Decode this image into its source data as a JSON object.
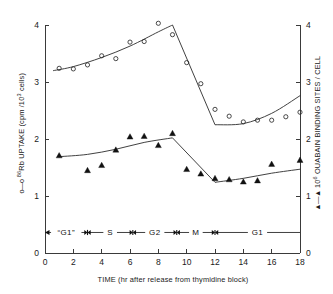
{
  "chart_data": {
    "type": "scatter",
    "title": "",
    "xlabel": "TIME  (hr after release from thymidine block)",
    "ylabel": "o—o  86Rb UPTAKE (cpm / 103 cells)",
    "ylabel_right": "▲—▲  106 OUABAIN BINDING SITES / CELL",
    "xlim": [
      0,
      18
    ],
    "ylim": [
      0,
      4
    ],
    "ylim_right": [
      0,
      4
    ],
    "xticks": [
      0,
      2,
      4,
      6,
      8,
      10,
      12,
      14,
      16,
      18
    ],
    "yticks": [
      0,
      1,
      2,
      3,
      4
    ],
    "yticks_right": [
      0,
      1,
      2,
      3,
      4
    ],
    "grid": false,
    "legend_position": "axis-labels",
    "series": [
      {
        "name": "86Rb uptake (cpm / 10^3 cells)",
        "marker": "open-circle",
        "axis": "left",
        "x": [
          1,
          2,
          3,
          4,
          5,
          6,
          7,
          8,
          9,
          10,
          11,
          12,
          13,
          14,
          15,
          16,
          17,
          18
        ],
        "values": [
          3.24,
          3.23,
          3.3,
          3.46,
          3.41,
          3.7,
          3.71,
          4.03,
          3.83,
          3.34,
          2.97,
          2.52,
          2.4,
          2.3,
          2.33,
          2.33,
          2.39,
          2.47
        ],
        "fit_line_x": [
          0.6,
          2.0,
          4.0,
          6.0,
          8.0,
          9.0,
          12.0,
          14.0,
          16.0,
          18.0
        ],
        "fit_line_y": [
          3.2,
          3.27,
          3.43,
          3.63,
          3.88,
          4.0,
          2.25,
          2.27,
          2.45,
          2.76
        ]
      },
      {
        "name": "10^6 ouabain binding sites / cell",
        "marker": "filled-triangle",
        "axis": "right",
        "x": [
          1,
          3,
          4,
          5,
          6,
          7,
          8,
          9,
          10,
          11,
          12,
          13,
          14,
          15,
          16,
          18
        ],
        "values": [
          1.71,
          1.45,
          1.54,
          1.81,
          2.04,
          2.05,
          1.89,
          2.1,
          1.47,
          1.39,
          1.31,
          1.29,
          1.25,
          1.27,
          1.56,
          1.63
        ],
        "fit_line_x": [
          1.0,
          3.0,
          5.0,
          7.0,
          9.0,
          12.0,
          14.0,
          16.0,
          18.0
        ],
        "fit_line_y": [
          1.69,
          1.73,
          1.82,
          1.94,
          2.02,
          1.24,
          1.31,
          1.4,
          1.47
        ]
      }
    ],
    "phase_bar": {
      "y_value": 0.36,
      "segments": [
        {
          "label": "“G1”",
          "start": 0.0,
          "end": 3.0
        },
        {
          "label": "S",
          "start": 3.0,
          "end": 6.2
        },
        {
          "label": "G2",
          "start": 6.2,
          "end": 9.3
        },
        {
          "label": "M",
          "start": 9.3,
          "end": 12.0
        },
        {
          "label": "G1",
          "start": 12.0,
          "end": 18.0
        }
      ],
      "separators": [
        3.0,
        6.2,
        9.3,
        12.0
      ]
    },
    "colors": {
      "axis": "#3a3a3a",
      "curve": "#2b2b2b",
      "marker_open": "#2b2b2b",
      "marker_filled": "#111111"
    }
  },
  "axes": {
    "x_title": "TIME  (hr after release from thymidine block)",
    "y_left_prefix": "o—o",
    "y_left_isotope": "86",
    "y_left_main": "Rb UPTAKE (cpm /",
    "y_left_exp": "3",
    "y_left_tail": " cells)",
    "y_left_ten": "10",
    "y_right_prefix": "▲—▲",
    "y_right_ten": "10",
    "y_right_exp": "6",
    "y_right_main": "OUABAIN BINDING SITES / CELL"
  },
  "ticks": {
    "x": [
      "0",
      "2",
      "4",
      "6",
      "8",
      "10",
      "12",
      "14",
      "16",
      "18"
    ],
    "y_left": [
      "0",
      "1",
      "2",
      "3",
      "4"
    ],
    "y_right": [
      "0",
      "1",
      "2",
      "3",
      "4"
    ]
  },
  "phases": {
    "g1_quoted": "“G1”",
    "s": "S",
    "g2": "G2",
    "m": "M",
    "g1": "G1"
  }
}
